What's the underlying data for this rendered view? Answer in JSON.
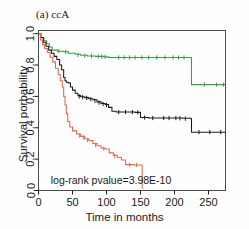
{
  "figure": {
    "panel_title": "(a) ccA",
    "background_color": "#fefefe"
  },
  "chart_data": {
    "type": "line",
    "title": "(a) ccA",
    "xlabel": "Time in months",
    "ylabel": "Survival porbability",
    "xlim": [
      0,
      275
    ],
    "ylim": [
      0.0,
      1.02
    ],
    "xticks": [
      0,
      50,
      100,
      150,
      200,
      250
    ],
    "xticklabels": [
      "0",
      "50",
      "100",
      "150",
      "200",
      "250"
    ],
    "yticks": [
      0.0,
      0.2,
      0.4,
      0.6,
      0.8,
      1.0
    ],
    "yticklabels": [
      "0.0",
      "0.2",
      "0.4",
      "0.6",
      "0.8",
      "1.0"
    ],
    "grid": false,
    "legend_position": "none",
    "annotations": [
      {
        "text": "log-rank pvalue=3.98E-10",
        "x": 18,
        "y": 0.04
      }
    ],
    "series": [
      {
        "name": "green-group",
        "color": "#3f9a48",
        "style": "kaplan-meier-step",
        "points": [
          [
            0,
            1.0
          ],
          [
            4,
            0.975
          ],
          [
            8,
            0.955
          ],
          [
            12,
            0.935
          ],
          [
            16,
            0.915
          ],
          [
            20,
            0.895
          ],
          [
            28,
            0.888
          ],
          [
            36,
            0.885
          ],
          [
            44,
            0.875
          ],
          [
            54,
            0.868
          ],
          [
            62,
            0.862
          ],
          [
            72,
            0.858
          ],
          [
            84,
            0.855
          ],
          [
            96,
            0.852
          ],
          [
            103,
            0.848
          ],
          [
            112,
            0.848
          ],
          [
            130,
            0.848
          ],
          [
            150,
            0.848
          ],
          [
            170,
            0.848
          ],
          [
            190,
            0.848
          ],
          [
            210,
            0.848
          ],
          [
            224,
            0.848
          ],
          [
            225,
            0.675
          ],
          [
            240,
            0.675
          ],
          [
            258,
            0.675
          ],
          [
            275,
            0.675
          ]
        ],
        "censor_marks": [
          [
            30,
            0.888
          ],
          [
            40,
            0.885
          ],
          [
            58,
            0.865
          ],
          [
            68,
            0.86
          ],
          [
            78,
            0.857
          ],
          [
            88,
            0.855
          ],
          [
            93,
            0.853
          ],
          [
            98,
            0.852
          ],
          [
            118,
            0.848
          ],
          [
            126,
            0.848
          ],
          [
            134,
            0.848
          ],
          [
            142,
            0.848
          ],
          [
            152,
            0.848
          ],
          [
            162,
            0.848
          ],
          [
            174,
            0.848
          ],
          [
            186,
            0.848
          ],
          [
            198,
            0.848
          ],
          [
            206,
            0.848
          ],
          [
            214,
            0.848
          ],
          [
            244,
            0.675
          ],
          [
            262,
            0.675
          ],
          [
            272,
            0.675
          ]
        ]
      },
      {
        "name": "black-group",
        "color": "#1a1a1a",
        "style": "kaplan-meier-step",
        "points": [
          [
            0,
            1.0
          ],
          [
            3,
            0.975
          ],
          [
            7,
            0.945
          ],
          [
            11,
            0.92
          ],
          [
            15,
            0.895
          ],
          [
            19,
            0.875
          ],
          [
            23,
            0.855
          ],
          [
            27,
            0.835
          ],
          [
            31,
            0.8
          ],
          [
            34,
            0.77
          ],
          [
            37,
            0.72
          ],
          [
            39,
            0.7
          ],
          [
            41,
            0.69
          ],
          [
            44,
            0.685
          ],
          [
            47,
            0.66
          ],
          [
            50,
            0.64
          ],
          [
            54,
            0.62
          ],
          [
            58,
            0.605
          ],
          [
            62,
            0.598
          ],
          [
            68,
            0.592
          ],
          [
            74,
            0.585
          ],
          [
            80,
            0.578
          ],
          [
            86,
            0.565
          ],
          [
            92,
            0.555
          ],
          [
            98,
            0.548
          ],
          [
            103,
            0.53
          ],
          [
            108,
            0.505
          ],
          [
            114,
            0.5
          ],
          [
            124,
            0.5
          ],
          [
            134,
            0.5
          ],
          [
            142,
            0.498
          ],
          [
            150,
            0.465
          ],
          [
            162,
            0.462
          ],
          [
            178,
            0.462
          ],
          [
            196,
            0.462
          ],
          [
            212,
            0.46
          ],
          [
            224,
            0.458
          ],
          [
            225,
            0.372
          ],
          [
            242,
            0.372
          ],
          [
            260,
            0.372
          ],
          [
            275,
            0.372
          ]
        ],
        "censor_marks": [
          [
            60,
            0.6
          ],
          [
            65,
            0.595
          ],
          [
            71,
            0.59
          ],
          [
            77,
            0.582
          ],
          [
            83,
            0.572
          ],
          [
            89,
            0.56
          ],
          [
            95,
            0.552
          ],
          [
            100,
            0.545
          ],
          [
            118,
            0.5
          ],
          [
            128,
            0.5
          ],
          [
            138,
            0.5
          ],
          [
            146,
            0.498
          ],
          [
            156,
            0.465
          ],
          [
            168,
            0.462
          ],
          [
            184,
            0.462
          ],
          [
            192,
            0.462
          ],
          [
            202,
            0.462
          ],
          [
            208,
            0.46
          ],
          [
            216,
            0.458
          ],
          [
            236,
            0.372
          ],
          [
            252,
            0.372
          ],
          [
            268,
            0.372
          ]
        ]
      },
      {
        "name": "red-group",
        "color": "#e8654a",
        "style": "kaplan-meier-step",
        "points": [
          [
            0,
            1.0
          ],
          [
            3,
            0.96
          ],
          [
            6,
            0.93
          ],
          [
            9,
            0.905
          ],
          [
            13,
            0.88
          ],
          [
            17,
            0.85
          ],
          [
            21,
            0.82
          ],
          [
            25,
            0.78
          ],
          [
            29,
            0.74
          ],
          [
            32,
            0.7
          ],
          [
            35,
            0.66
          ],
          [
            37,
            0.6
          ],
          [
            39,
            0.545
          ],
          [
            41,
            0.49
          ],
          [
            43,
            0.44
          ],
          [
            46,
            0.405
          ],
          [
            50,
            0.38
          ],
          [
            56,
            0.36
          ],
          [
            62,
            0.345
          ],
          [
            68,
            0.33
          ],
          [
            74,
            0.318
          ],
          [
            80,
            0.3
          ],
          [
            86,
            0.285
          ],
          [
            92,
            0.27
          ],
          [
            98,
            0.265
          ],
          [
            104,
            0.24
          ],
          [
            110,
            0.225
          ],
          [
            116,
            0.21
          ],
          [
            122,
            0.195
          ],
          [
            128,
            0.165
          ],
          [
            140,
            0.163
          ],
          [
            150,
            0.163
          ],
          [
            152,
            0.163
          ],
          [
            152.5,
            0.01
          ]
        ],
        "censor_marks": [
          [
            60,
            0.35
          ],
          [
            66,
            0.338
          ],
          [
            72,
            0.322
          ],
          [
            84,
            0.29
          ],
          [
            96,
            0.268
          ],
          [
            112,
            0.22
          ],
          [
            134,
            0.164
          ],
          [
            144,
            0.163
          ]
        ]
      }
    ]
  }
}
